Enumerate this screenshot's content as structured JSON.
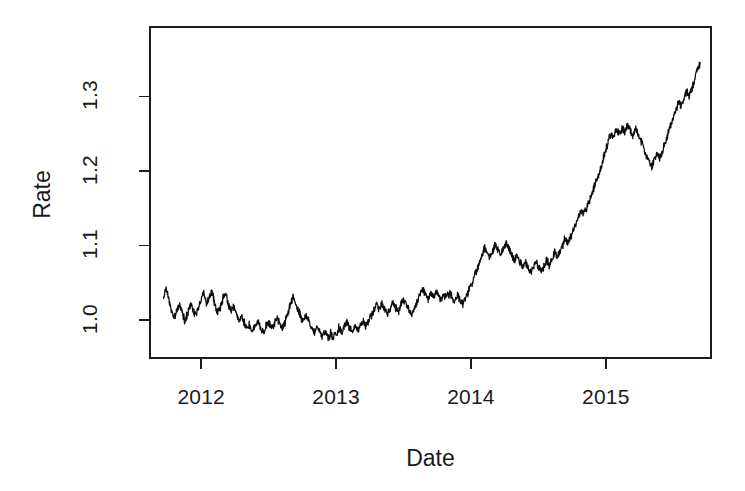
{
  "chart_data": {
    "type": "line",
    "title": "",
    "subtitle": "",
    "xlabel": "Date",
    "ylabel": "Rate",
    "grid": false,
    "legend": false,
    "legend_position": "none",
    "xlim": [
      2011.62,
      2015.78
    ],
    "ylim": [
      0.949,
      1.393
    ],
    "xticks": [
      2012,
      2013,
      2014,
      2015
    ],
    "xtick_labels": [
      "2012",
      "2013",
      "2014",
      "2015"
    ],
    "yticks": [
      1.0,
      1.1,
      1.2,
      1.3
    ],
    "ytick_labels": [
      "1.0",
      "1.1",
      "1.2",
      "1.3"
    ],
    "line_color": "#0d0d0d",
    "background_color": "#ffffff",
    "series": [
      {
        "name": "Rate",
        "x": [
          2011.72,
          2011.74,
          2011.76,
          2011.78,
          2011.8,
          2011.82,
          2011.84,
          2011.86,
          2011.88,
          2011.9,
          2011.92,
          2011.94,
          2011.96,
          2011.98,
          2012.0,
          2012.02,
          2012.04,
          2012.06,
          2012.08,
          2012.1,
          2012.12,
          2012.14,
          2012.16,
          2012.18,
          2012.2,
          2012.22,
          2012.24,
          2012.26,
          2012.28,
          2012.3,
          2012.32,
          2012.34,
          2012.36,
          2012.38,
          2012.4,
          2012.42,
          2012.44,
          2012.46,
          2012.48,
          2012.5,
          2012.52,
          2012.54,
          2012.56,
          2012.58,
          2012.6,
          2012.62,
          2012.64,
          2012.66,
          2012.68,
          2012.7,
          2012.72,
          2012.74,
          2012.76,
          2012.78,
          2012.8,
          2012.82,
          2012.84,
          2012.86,
          2012.88,
          2012.9,
          2012.92,
          2012.94,
          2012.96,
          2012.98,
          2013.0,
          2013.02,
          2013.04,
          2013.06,
          2013.08,
          2013.1,
          2013.12,
          2013.14,
          2013.16,
          2013.18,
          2013.2,
          2013.22,
          2013.24,
          2013.26,
          2013.28,
          2013.3,
          2013.32,
          2013.34,
          2013.36,
          2013.38,
          2013.4,
          2013.42,
          2013.44,
          2013.46,
          2013.48,
          2013.5,
          2013.52,
          2013.54,
          2013.56,
          2013.58,
          2013.6,
          2013.62,
          2013.64,
          2013.66,
          2013.68,
          2013.7,
          2013.72,
          2013.74,
          2013.76,
          2013.78,
          2013.8,
          2013.82,
          2013.84,
          2013.86,
          2013.88,
          2013.9,
          2013.92,
          2013.94,
          2013.96,
          2013.98,
          2014.0,
          2014.02,
          2014.04,
          2014.06,
          2014.08,
          2014.1,
          2014.12,
          2014.14,
          2014.16,
          2014.18,
          2014.2,
          2014.22,
          2014.24,
          2014.26,
          2014.28,
          2014.3,
          2014.32,
          2014.34,
          2014.36,
          2014.38,
          2014.4,
          2014.42,
          2014.44,
          2014.46,
          2014.48,
          2014.5,
          2014.52,
          2014.54,
          2014.56,
          2014.58,
          2014.6,
          2014.62,
          2014.64,
          2014.66,
          2014.68,
          2014.7,
          2014.72,
          2014.74,
          2014.76,
          2014.78,
          2014.8,
          2014.82,
          2014.84,
          2014.86,
          2014.88,
          2014.9,
          2014.92,
          2014.94,
          2014.96,
          2014.98,
          2015.0,
          2015.02,
          2015.04,
          2015.06,
          2015.08,
          2015.1,
          2015.12,
          2015.14,
          2015.16,
          2015.18,
          2015.2,
          2015.22,
          2015.24,
          2015.26,
          2015.28,
          2015.3,
          2015.32,
          2015.34,
          2015.36,
          2015.38,
          2015.4,
          2015.42,
          2015.44,
          2015.46,
          2015.48,
          2015.5,
          2015.52,
          2015.54,
          2015.56,
          2015.58,
          2015.6,
          2015.62,
          2015.64,
          2015.66,
          2015.68,
          2015.7
        ],
        "y": [
          1.032,
          1.041,
          1.028,
          1.012,
          1.002,
          1.013,
          1.023,
          1.008,
          0.998,
          1.011,
          1.022,
          1.014,
          1.006,
          1.016,
          1.027,
          1.04,
          1.019,
          1.031,
          1.038,
          1.021,
          1.009,
          1.016,
          1.028,
          1.035,
          1.022,
          1.013,
          1.019,
          1.009,
          0.999,
          1.004,
          0.996,
          0.989,
          0.994,
          0.986,
          0.992,
          0.998,
          0.99,
          0.984,
          0.991,
          0.997,
          0.989,
          0.994,
          1.002,
          0.995,
          0.988,
          0.996,
          1.008,
          1.02,
          1.031,
          1.024,
          1.014,
          1.004,
          0.997,
          1.006,
          0.999,
          0.991,
          0.984,
          0.992,
          0.985,
          0.978,
          0.984,
          0.977,
          0.982,
          0.976,
          0.981,
          0.989,
          0.983,
          0.99,
          0.997,
          0.99,
          0.984,
          0.991,
          0.986,
          0.993,
          0.999,
          0.992,
          0.998,
          1.006,
          1.013,
          1.021,
          1.014,
          1.022,
          1.015,
          1.008,
          1.016,
          1.024,
          1.017,
          1.011,
          1.019,
          1.028,
          1.021,
          1.014,
          1.007,
          1.015,
          1.024,
          1.033,
          1.041,
          1.034,
          1.027,
          1.035,
          1.03,
          1.038,
          1.032,
          1.026,
          1.034,
          1.029,
          1.036,
          1.031,
          1.025,
          1.033,
          1.028,
          1.022,
          1.03,
          1.038,
          1.047,
          1.056,
          1.066,
          1.076,
          1.087,
          1.097,
          1.09,
          1.083,
          1.092,
          1.101,
          1.094,
          1.086,
          1.095,
          1.104,
          1.096,
          1.088,
          1.08,
          1.086,
          1.078,
          1.071,
          1.079,
          1.072,
          1.064,
          1.07,
          1.078,
          1.071,
          1.064,
          1.072,
          1.081,
          1.074,
          1.082,
          1.091,
          1.084,
          1.092,
          1.101,
          1.11,
          1.103,
          1.112,
          1.121,
          1.13,
          1.139,
          1.148,
          1.142,
          1.151,
          1.161,
          1.171,
          1.181,
          1.192,
          1.203,
          1.215,
          1.228,
          1.241,
          1.252,
          1.245,
          1.256,
          1.249,
          1.258,
          1.251,
          1.262,
          1.255,
          1.247,
          1.256,
          1.248,
          1.24,
          1.231,
          1.222,
          1.213,
          1.205,
          1.214,
          1.224,
          1.217,
          1.227,
          1.238,
          1.249,
          1.26,
          1.271,
          1.282,
          1.293,
          1.286,
          1.297,
          1.308,
          1.301,
          1.312,
          1.324,
          1.336,
          1.345
        ]
      }
    ],
    "plot_box": {
      "left": 150,
      "right": 711,
      "top": 27,
      "bottom": 358
    },
    "observed_extremes": {
      "start_value": 1.032,
      "min_value": 0.976,
      "max_value": 1.345,
      "end_value": 1.345
    }
  }
}
